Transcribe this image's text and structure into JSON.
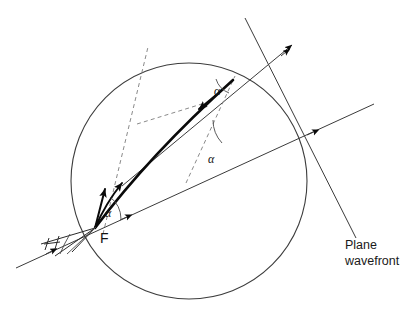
{
  "figure": {
    "background_color": "#ffffff",
    "labels": {
      "focus": "F",
      "alpha_bottom": "α",
      "alpha_middle": "α",
      "alpha_top": "α",
      "caption_line1": "Plane",
      "caption_line2": "wavefront"
    },
    "colors": {
      "circle_stroke": "#3d3d3d",
      "thin_stroke": "#3b3b3b",
      "thick_stroke": "#0a0a0a",
      "dashed_stroke": "#8a8a8a",
      "text": "#111111"
    },
    "geometry": {
      "circle": {
        "cx": 189,
        "cy": 181,
        "r": 118
      },
      "focus_point": {
        "x": 95,
        "y": 228
      },
      "wavefront_lower": {
        "x1": 16,
        "y1": 268,
        "x2": 296,
        "y2": 120
      },
      "wavefront_upper": {
        "x1": 122,
        "y1": 186,
        "x2": 290,
        "y2": 47
      },
      "plane_wavefront_line": {
        "x1": 245,
        "y1": 18,
        "x2": 356,
        "y2": 238
      },
      "ray_curve_start": {
        "x": 95,
        "y": 228
      },
      "ray_curve_end": {
        "x": 233,
        "y": 80
      }
    },
    "icons": {
      "arrowhead": "arrowhead-icon",
      "angle_arc": "angle-arc-icon",
      "tick_mark": "tick-mark-icon"
    }
  }
}
